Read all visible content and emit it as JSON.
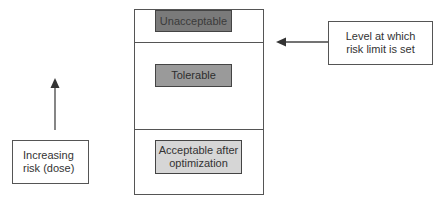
{
  "diagram": {
    "zones": [
      {
        "label": "Unacceptable",
        "fill": "#7a7a7a"
      },
      {
        "label": "Tolerable",
        "fill": "#9a9a9a"
      },
      {
        "label": "Acceptable after optimization",
        "line1": "Acceptable after",
        "line2": "optimization",
        "fill": "#d6d6d6"
      }
    ],
    "callouts": {
      "risk_limit": {
        "line1": "Level at which",
        "line2": "risk limit is set"
      },
      "increasing_risk": {
        "line1": "Increasing",
        "line2": "risk (dose)"
      }
    },
    "colors": {
      "line": "#555555",
      "text": "#333333"
    }
  }
}
